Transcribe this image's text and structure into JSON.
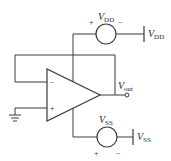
{
  "diagram": {
    "opamp": {
      "inverting_sign": "−",
      "noninverting_sign": "+"
    },
    "vdd_source": {
      "label_main": "V",
      "label_sub": "DD",
      "plus": "+",
      "minus": "−"
    },
    "vdd_terminal": {
      "label_main": "V",
      "label_sub": "DD"
    },
    "vss_source": {
      "label_main": "V",
      "label_sub": "SS",
      "plus": "+",
      "minus": "−"
    },
    "vss_terminal": {
      "label_main": "V",
      "label_sub": "SS"
    },
    "output": {
      "label_main": "V",
      "label_sub": "out"
    }
  }
}
